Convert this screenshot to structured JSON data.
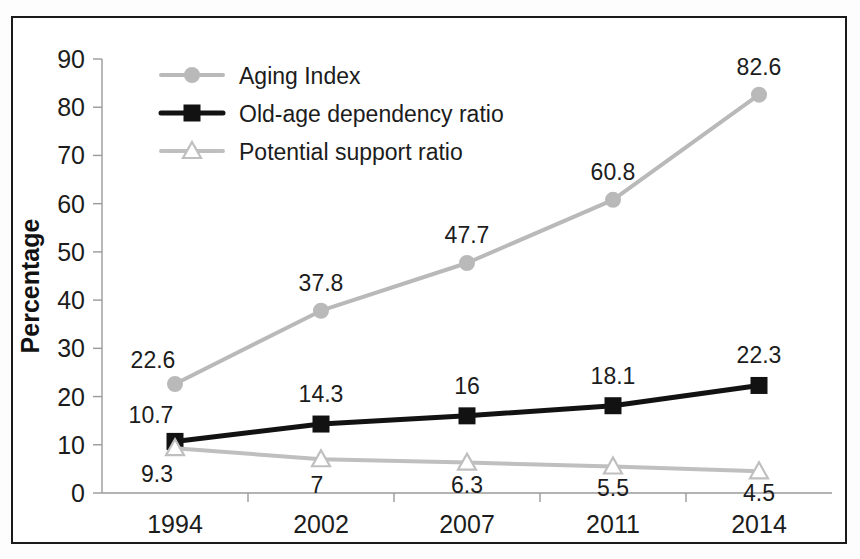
{
  "chart_data": {
    "type": "line",
    "title": "",
    "xlabel": "",
    "ylabel": "Percentage",
    "categories": [
      "1994",
      "2002",
      "2007",
      "2011",
      "2014"
    ],
    "ylim": [
      0,
      90
    ],
    "yticks": [
      0,
      10,
      20,
      30,
      40,
      50,
      60,
      70,
      80,
      90
    ],
    "ytick_labels": [
      "0",
      "10",
      "20",
      "30",
      "40",
      "50",
      "60",
      "70",
      "80",
      "90"
    ],
    "grid": false,
    "legend_position": "top-left",
    "series": [
      {
        "name": "Aging Index",
        "values": [
          22.6,
          37.8,
          47.7,
          60.8,
          82.6
        ],
        "labels": [
          "22.6",
          "37.8",
          "47.7",
          "60.8",
          "82.6"
        ],
        "color": "#b9b9b9",
        "marker": "circle",
        "marker_fill": "#b9b9b9",
        "line_width": 4
      },
      {
        "name": "Old-age dependency ratio",
        "values": [
          10.7,
          14.3,
          16,
          18.1,
          22.3
        ],
        "labels": [
          "10.7",
          "14.3",
          "16",
          "18.1",
          "22.3"
        ],
        "color": "#121212",
        "marker": "square",
        "marker_fill": "#121212",
        "line_width": 5
      },
      {
        "name": "Potential support ratio",
        "values": [
          9.3,
          7,
          6.3,
          5.5,
          4.5
        ],
        "labels": [
          "9.3",
          "7",
          "6.3",
          "5.5",
          "4.5"
        ],
        "color": "#bfbfbf",
        "marker": "triangle",
        "marker_fill": "#ffffff",
        "line_width": 4
      }
    ]
  },
  "legend": {
    "items": [
      {
        "label": "Aging Index",
        "marker": "circle",
        "color": "#b9b9b9"
      },
      {
        "label": "Old-age dependency ratio",
        "marker": "square",
        "color": "#121212"
      },
      {
        "label": "Potential support ratio",
        "marker": "triangle",
        "color": "#bfbfbf"
      }
    ]
  },
  "axis": {
    "y_title": "Percentage"
  }
}
